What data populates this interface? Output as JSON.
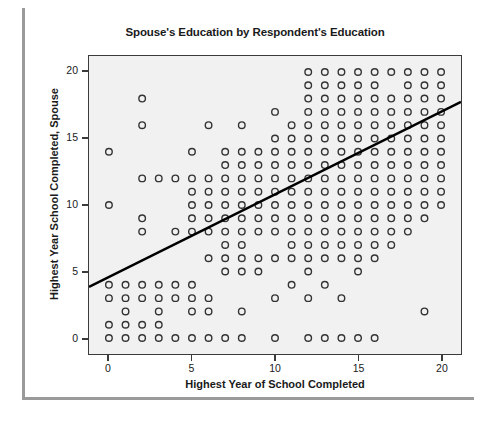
{
  "chart_data": {
    "type": "scatter",
    "title": "Spouse's Education by Respondent's Education",
    "xlabel": "Highest Year of School Completed",
    "ylabel": "Highest Year School Completed, Spouse",
    "xlim": [
      -1.2,
      21.2
    ],
    "ylim": [
      -1.2,
      21.2
    ],
    "xticks": [
      0,
      5,
      10,
      15,
      20
    ],
    "xtick_labels": [
      "0",
      "5",
      "10",
      "15",
      "20"
    ],
    "yticks": [
      0,
      5,
      10,
      15,
      20
    ],
    "ytick_labels": [
      "0",
      "5",
      "10",
      "15",
      "20"
    ],
    "grid": false,
    "legend": "none",
    "marker": "open-circle",
    "marker_color": "#333333",
    "plot_background": "#f1f1f1",
    "annotations": [
      {
        "name": "r-squared",
        "text": "R Sq Linear = 0.399",
        "x": 17.0,
        "y": 2.6
      }
    ],
    "fit_line": {
      "type": "linear",
      "r_squared": 0.399,
      "color": "#000000",
      "x_start": -1.2,
      "y_start": 3.85,
      "x_end": 21.2,
      "y_end": 17.75
    },
    "points": [
      [
        0,
        0
      ],
      [
        0,
        1
      ],
      [
        0,
        3
      ],
      [
        0,
        4
      ],
      [
        0,
        10
      ],
      [
        0,
        14
      ],
      [
        1,
        0
      ],
      [
        1,
        1
      ],
      [
        1,
        2
      ],
      [
        1,
        3
      ],
      [
        1,
        4
      ],
      [
        2,
        0
      ],
      [
        2,
        1
      ],
      [
        2,
        3
      ],
      [
        2,
        4
      ],
      [
        2,
        8
      ],
      [
        2,
        9
      ],
      [
        2,
        12
      ],
      [
        2,
        16
      ],
      [
        2,
        18
      ],
      [
        3,
        0
      ],
      [
        3,
        1
      ],
      [
        3,
        2
      ],
      [
        3,
        3
      ],
      [
        3,
        4
      ],
      [
        3,
        12
      ],
      [
        4,
        0
      ],
      [
        4,
        3
      ],
      [
        4,
        4
      ],
      [
        4,
        8
      ],
      [
        4,
        12
      ],
      [
        5,
        0
      ],
      [
        5,
        2
      ],
      [
        5,
        3
      ],
      [
        5,
        4
      ],
      [
        5,
        8
      ],
      [
        5,
        9
      ],
      [
        5,
        10
      ],
      [
        5,
        11
      ],
      [
        5,
        12
      ],
      [
        5,
        14
      ],
      [
        6,
        0
      ],
      [
        6,
        2
      ],
      [
        6,
        3
      ],
      [
        6,
        6
      ],
      [
        6,
        8
      ],
      [
        6,
        9
      ],
      [
        6,
        10
      ],
      [
        6,
        11
      ],
      [
        6,
        12
      ],
      [
        6,
        16
      ],
      [
        7,
        0
      ],
      [
        7,
        5
      ],
      [
        7,
        6
      ],
      [
        7,
        7
      ],
      [
        7,
        8
      ],
      [
        7,
        9
      ],
      [
        7,
        10
      ],
      [
        7,
        11
      ],
      [
        7,
        12
      ],
      [
        7,
        13
      ],
      [
        7,
        14
      ],
      [
        8,
        0
      ],
      [
        8,
        2
      ],
      [
        8,
        5
      ],
      [
        8,
        6
      ],
      [
        8,
        7
      ],
      [
        8,
        8
      ],
      [
        8,
        9
      ],
      [
        8,
        10
      ],
      [
        8,
        11
      ],
      [
        8,
        12
      ],
      [
        8,
        13
      ],
      [
        8,
        14
      ],
      [
        8,
        16
      ],
      [
        9,
        5
      ],
      [
        9,
        6
      ],
      [
        9,
        8
      ],
      [
        9,
        9
      ],
      [
        9,
        10
      ],
      [
        9,
        11
      ],
      [
        9,
        12
      ],
      [
        9,
        13
      ],
      [
        9,
        14
      ],
      [
        10,
        0
      ],
      [
        10,
        3
      ],
      [
        10,
        6
      ],
      [
        10,
        8
      ],
      [
        10,
        9
      ],
      [
        10,
        10
      ],
      [
        10,
        11
      ],
      [
        10,
        12
      ],
      [
        10,
        13
      ],
      [
        10,
        14
      ],
      [
        10,
        15
      ],
      [
        10,
        17
      ],
      [
        11,
        4
      ],
      [
        11,
        6
      ],
      [
        11,
        7
      ],
      [
        11,
        8
      ],
      [
        11,
        9
      ],
      [
        11,
        10
      ],
      [
        11,
        11
      ],
      [
        11,
        12
      ],
      [
        11,
        13
      ],
      [
        11,
        14
      ],
      [
        11,
        15
      ],
      [
        11,
        16
      ],
      [
        12,
        0
      ],
      [
        12,
        3
      ],
      [
        12,
        5
      ],
      [
        12,
        6
      ],
      [
        12,
        7
      ],
      [
        12,
        8
      ],
      [
        12,
        9
      ],
      [
        12,
        10
      ],
      [
        12,
        11
      ],
      [
        12,
        12
      ],
      [
        12,
        13
      ],
      [
        12,
        14
      ],
      [
        12,
        15
      ],
      [
        12,
        16
      ],
      [
        12,
        17
      ],
      [
        12,
        18
      ],
      [
        12,
        19
      ],
      [
        12,
        20
      ],
      [
        13,
        0
      ],
      [
        13,
        4
      ],
      [
        13,
        6
      ],
      [
        13,
        7
      ],
      [
        13,
        8
      ],
      [
        13,
        9
      ],
      [
        13,
        10
      ],
      [
        13,
        11
      ],
      [
        13,
        12
      ],
      [
        13,
        13
      ],
      [
        13,
        14
      ],
      [
        13,
        15
      ],
      [
        13,
        16
      ],
      [
        13,
        17
      ],
      [
        13,
        18
      ],
      [
        13,
        19
      ],
      [
        13,
        20
      ],
      [
        14,
        0
      ],
      [
        14,
        3
      ],
      [
        14,
        6
      ],
      [
        14,
        7
      ],
      [
        14,
        8
      ],
      [
        14,
        9
      ],
      [
        14,
        10
      ],
      [
        14,
        11
      ],
      [
        14,
        12
      ],
      [
        14,
        13
      ],
      [
        14,
        14
      ],
      [
        14,
        15
      ],
      [
        14,
        16
      ],
      [
        14,
        17
      ],
      [
        14,
        18
      ],
      [
        14,
        19
      ],
      [
        14,
        20
      ],
      [
        15,
        0
      ],
      [
        15,
        5
      ],
      [
        15,
        6
      ],
      [
        15,
        7
      ],
      [
        15,
        8
      ],
      [
        15,
        9
      ],
      [
        15,
        10
      ],
      [
        15,
        11
      ],
      [
        15,
        12
      ],
      [
        15,
        13
      ],
      [
        15,
        14
      ],
      [
        15,
        15
      ],
      [
        15,
        16
      ],
      [
        15,
        17
      ],
      [
        15,
        18
      ],
      [
        15,
        19
      ],
      [
        15,
        20
      ],
      [
        16,
        0
      ],
      [
        16,
        6
      ],
      [
        16,
        7
      ],
      [
        16,
        8
      ],
      [
        16,
        9
      ],
      [
        16,
        10
      ],
      [
        16,
        11
      ],
      [
        16,
        12
      ],
      [
        16,
        13
      ],
      [
        16,
        14
      ],
      [
        16,
        15
      ],
      [
        16,
        16
      ],
      [
        16,
        17
      ],
      [
        16,
        18
      ],
      [
        16,
        19
      ],
      [
        16,
        20
      ],
      [
        17,
        7
      ],
      [
        17,
        8
      ],
      [
        17,
        9
      ],
      [
        17,
        10
      ],
      [
        17,
        11
      ],
      [
        17,
        12
      ],
      [
        17,
        13
      ],
      [
        17,
        14
      ],
      [
        17,
        15
      ],
      [
        17,
        16
      ],
      [
        17,
        17
      ],
      [
        17,
        18
      ],
      [
        17,
        20
      ],
      [
        18,
        8
      ],
      [
        18,
        9
      ],
      [
        18,
        10
      ],
      [
        18,
        11
      ],
      [
        18,
        12
      ],
      [
        18,
        13
      ],
      [
        18,
        14
      ],
      [
        18,
        15
      ],
      [
        18,
        16
      ],
      [
        18,
        17
      ],
      [
        18,
        18
      ],
      [
        18,
        19
      ],
      [
        18,
        20
      ],
      [
        19,
        2
      ],
      [
        19,
        9
      ],
      [
        19,
        10
      ],
      [
        19,
        11
      ],
      [
        19,
        12
      ],
      [
        19,
        13
      ],
      [
        19,
        14
      ],
      [
        19,
        15
      ],
      [
        19,
        16
      ],
      [
        19,
        17
      ],
      [
        19,
        18
      ],
      [
        19,
        19
      ],
      [
        19,
        20
      ],
      [
        20,
        10
      ],
      [
        20,
        11
      ],
      [
        20,
        12
      ],
      [
        20,
        13
      ],
      [
        20,
        14
      ],
      [
        20,
        15
      ],
      [
        20,
        16
      ],
      [
        20,
        17
      ],
      [
        20,
        18
      ],
      [
        20,
        19
      ],
      [
        20,
        20
      ]
    ]
  }
}
